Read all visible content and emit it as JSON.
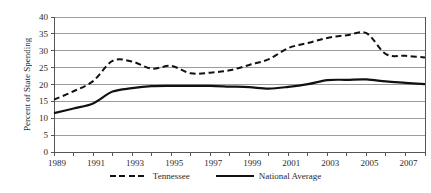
{
  "chart_data": {
    "type": "line",
    "title": "",
    "xlabel": "",
    "ylabel": "Percent of State Spending",
    "ylim": [
      0,
      40
    ],
    "y_tick_step": 5,
    "grid": "horizontal",
    "legend_position": "bottom-center",
    "x": [
      1989,
      1990,
      1991,
      1992,
      1993,
      1994,
      1995,
      1996,
      1997,
      1998,
      1999,
      2000,
      2001,
      2002,
      2003,
      2004,
      2005,
      2006,
      2007,
      2008
    ],
    "x_tick_labels": [
      "1989",
      "1991",
      "1993",
      "1995",
      "1997",
      "1999",
      "2001",
      "2003",
      "2005",
      "2007"
    ],
    "series": [
      {
        "name": "Tennessee",
        "style": "dashed",
        "color": "#111111",
        "values": [
          15.5,
          18.0,
          21.0,
          27.0,
          26.8,
          24.7,
          25.5,
          23.3,
          23.5,
          24.2,
          25.8,
          27.5,
          30.8,
          32.3,
          33.8,
          34.6,
          35.2,
          29.0,
          28.5,
          28.0
        ]
      },
      {
        "name": "National Average",
        "style": "solid",
        "color": "#111111",
        "values": [
          11.5,
          12.9,
          14.4,
          17.9,
          18.9,
          19.5,
          19.6,
          19.6,
          19.6,
          19.4,
          19.2,
          18.8,
          19.3,
          20.1,
          21.3,
          21.4,
          21.5,
          20.9,
          20.5,
          20.1
        ]
      }
    ]
  },
  "colors": {
    "background": "#ffffff",
    "gridline": "#9c9c9c",
    "axis": "#555555",
    "line": "#111111",
    "text": "#2a2a2a"
  }
}
